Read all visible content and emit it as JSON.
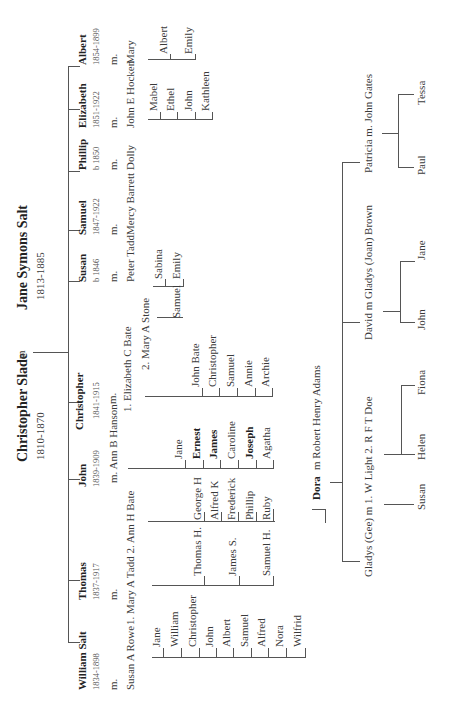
{
  "colors": {
    "line": "#555555",
    "text": "#333333",
    "background": "#ffffff"
  },
  "root": {
    "husband": {
      "name": "Christopher Slade",
      "dates": "1810-1870"
    },
    "marriage": "m",
    "wife": {
      "name": "Jane Symons Salt",
      "dates": "1813-1885"
    }
  },
  "children": [
    {
      "name": "William Salt",
      "dates": "1834-1898",
      "m": "m.",
      "spouse": "Susan A Rowe",
      "kids": [
        "Jane",
        "William",
        "Christopher",
        "John",
        "Albert",
        "Samuel",
        "Alfred",
        "Nora",
        "Wilfrid"
      ]
    },
    {
      "name": "Thomas",
      "dates": "1837-1917",
      "m": "m.",
      "spouse": "1. Mary A Tadd 2. Ann H Bate",
      "kids_1": [
        "Thomas H.",
        "James S.",
        "Samuel H."
      ],
      "kids_2": [
        "George H",
        "Alfred K",
        "Frederick",
        "Phillip",
        "Ruby",
        "Dora"
      ]
    },
    {
      "name": "John",
      "dates": "1839-1909",
      "m": "m.",
      "spouse": "m. Ann B Hanson",
      "kids": [
        "Jane",
        "Ernest",
        "James",
        "Caroline",
        "Joseph",
        "Agatha"
      ],
      "bold_kids": [
        "Ernest",
        "James",
        "Joseph"
      ]
    },
    {
      "name": "Christopher",
      "dates": "1841-1915",
      "m": "m.",
      "spouse_1": "1. Elizabeth C Bate",
      "spouse_2": "2. Mary A Stone",
      "kids_1": [
        "John Bate",
        "Christopher",
        "Samuel",
        "Annie",
        "Archie"
      ],
      "kids_2": [
        "Samuel"
      ]
    },
    {
      "name": "Susan",
      "dates": "b 1846",
      "m": "m.",
      "spouse": "Peter Tadd",
      "kids": [
        "Sabina",
        "Emily"
      ]
    },
    {
      "name": "Samuel",
      "dates": "1847-1922",
      "m": "m.",
      "spouse": "Mercy Barrett"
    },
    {
      "name": "Phillip",
      "dates": "b 1850",
      "m": "m.",
      "spouse": "Dolly"
    },
    {
      "name": "Elizabeth",
      "dates": "1851-1922",
      "m": "m.",
      "spouse": "John E Hocken",
      "kids": [
        "Mabel",
        "Ethel",
        "John",
        "Kathleen"
      ]
    },
    {
      "name": "Albert",
      "dates": "1854-1899",
      "m": "m.",
      "spouse": "Mary",
      "kids": [
        "Albert",
        "Emily"
      ]
    }
  ],
  "dora": {
    "name": "Dora",
    "spouse": "m Robert Henry Adams",
    "kids": [
      {
        "name": "Gladys (Gee) m 1. W Light  2. R F T Doe",
        "kids_1": [
          "Susan"
        ],
        "kids_2": [
          "Helen",
          "Fiona"
        ]
      },
      {
        "name": "David   m Gladys (Joan)  Brown",
        "kids": [
          "John",
          "Jane"
        ]
      },
      {
        "name": "Patricia   m. John Gates",
        "kids": [
          "Paul",
          "Tessa"
        ]
      }
    ]
  },
  "labels": [
    {
      "id": "root-husband",
      "t": "root.husband.name",
      "x": 242,
      "y": 22,
      "c": "bold big"
    },
    {
      "id": "root-husband-dates",
      "t": "root.husband.dates",
      "x": 244,
      "y": 41,
      "c": ""
    },
    {
      "id": "root-m",
      "t": "root.marriage",
      "x": 345,
      "y": 22,
      "c": ""
    },
    {
      "id": "root-wife",
      "t": "root.wife.name",
      "x": 394,
      "y": 22,
      "c": "bold big"
    },
    {
      "id": "root-wife-dates",
      "t": "root.wife.dates",
      "x": 404,
      "y": 41,
      "c": ""
    },
    {
      "id": "c0-name",
      "t": "children.0.name",
      "x": 14,
      "y": 83,
      "c": "bold"
    },
    {
      "id": "c0-dates",
      "t": "children.0.dates",
      "x": 14,
      "y": 98,
      "c": "date"
    },
    {
      "id": "c0-m",
      "t": "children.0.m",
      "x": 14,
      "y": 114,
      "c": ""
    },
    {
      "id": "c0-spouse",
      "t": "children.0.spouse",
      "x": 14,
      "y": 131,
      "c": ""
    },
    {
      "id": "c1-name",
      "t": "children.1.name",
      "x": 104,
      "y": 83,
      "c": "bold"
    },
    {
      "id": "c1-dates",
      "t": "children.1.dates",
      "x": 104,
      "y": 98,
      "c": "date"
    },
    {
      "id": "c1-m",
      "t": "children.1.m",
      "x": 104,
      "y": 114,
      "c": ""
    },
    {
      "id": "c1-spouse",
      "t": "children.1.spouse",
      "x": 79,
      "y": 131,
      "c": ""
    },
    {
      "id": "c2-name",
      "t": "children.2.name",
      "x": 217,
      "y": 83,
      "c": "bold"
    },
    {
      "id": "c2-dates",
      "t": "children.2.dates",
      "x": 217,
      "y": 98,
      "c": "date"
    },
    {
      "id": "c2-spouse",
      "t": "children.2.spouse",
      "x": 221,
      "y": 114,
      "c": ""
    },
    {
      "id": "c3-name",
      "t": "children.3.name",
      "x": 274,
      "y": 80,
      "c": "bold"
    },
    {
      "id": "c3-dates",
      "t": "children.3.dates",
      "x": 285,
      "y": 98,
      "c": "date"
    },
    {
      "id": "c3-m",
      "t": "children.3.m",
      "x": 300,
      "y": 113,
      "c": ""
    },
    {
      "id": "c3-spouse1",
      "t": "children.3.spouse_1",
      "x": 292,
      "y": 128,
      "c": ""
    },
    {
      "id": "c3-spouse2",
      "t": "children.3.spouse_2",
      "x": 334,
      "y": 146,
      "c": ""
    },
    {
      "id": "c4-name",
      "t": "children.4.name",
      "x": 422,
      "y": 83,
      "c": "bold"
    },
    {
      "id": "c4-dates",
      "t": "children.4.dates",
      "x": 422,
      "y": 98,
      "c": "date"
    },
    {
      "id": "c4-m",
      "t": "children.4.m",
      "x": 422,
      "y": 114,
      "c": ""
    },
    {
      "id": "c4-spouse",
      "t": "children.4.spouse",
      "x": 422,
      "y": 131,
      "c": ""
    },
    {
      "id": "c5-name",
      "t": "children.5.name",
      "x": 469,
      "y": 83,
      "c": "bold"
    },
    {
      "id": "c5-dates",
      "t": "children.5.dates",
      "x": 469,
      "y": 98,
      "c": "date"
    },
    {
      "id": "c5-m",
      "t": "children.5.m",
      "x": 469,
      "y": 114,
      "c": ""
    },
    {
      "id": "c5-spouse",
      "t": "children.5.spouse",
      "x": 469,
      "y": 131,
      "c": ""
    },
    {
      "id": "c6-name",
      "t": "children.6.name",
      "x": 534,
      "y": 83,
      "c": "bold"
    },
    {
      "id": "c6-dates",
      "t": "children.6.dates",
      "x": 534,
      "y": 98,
      "c": "date"
    },
    {
      "id": "c6-m",
      "t": "children.6.m",
      "x": 534,
      "y": 114,
      "c": ""
    },
    {
      "id": "c6-spouse",
      "t": "children.6.spouse",
      "x": 534,
      "y": 131,
      "c": ""
    },
    {
      "id": "c7-name",
      "t": "children.7.name",
      "x": 576,
      "y": 83,
      "c": "bold"
    },
    {
      "id": "c7-dates",
      "t": "children.7.dates",
      "x": 576,
      "y": 98,
      "c": "date"
    },
    {
      "id": "c7-m",
      "t": "children.7.m",
      "x": 576,
      "y": 114,
      "c": ""
    },
    {
      "id": "c7-spouse",
      "t": "children.7.spouse",
      "x": 576,
      "y": 131,
      "c": ""
    },
    {
      "id": "c8-name",
      "t": "children.8.name",
      "x": 639,
      "y": 83,
      "c": "bold"
    },
    {
      "id": "c8-dates",
      "t": "children.8.dates",
      "x": 639,
      "y": 98,
      "c": "date"
    },
    {
      "id": "c8-m",
      "t": "children.8.m",
      "x": 639,
      "y": 114,
      "c": ""
    },
    {
      "id": "c8-spouse",
      "t": "children.8.spouse",
      "x": 640,
      "y": 131,
      "c": ""
    },
    {
      "id": "w0",
      "t": "children.0.kids.0",
      "x": 57,
      "y": 157,
      "c": ""
    },
    {
      "id": "w1",
      "t": "children.0.kids.1",
      "x": 57,
      "y": 175,
      "c": ""
    },
    {
      "id": "w2",
      "t": "children.0.kids.2",
      "x": 57,
      "y": 193,
      "c": ""
    },
    {
      "id": "w3",
      "t": "children.0.kids.3",
      "x": 57,
      "y": 210,
      "c": ""
    },
    {
      "id": "w4",
      "t": "children.0.kids.4",
      "x": 57,
      "y": 227,
      "c": ""
    },
    {
      "id": "w5",
      "t": "children.0.kids.5",
      "x": 57,
      "y": 245,
      "c": ""
    },
    {
      "id": "w6",
      "t": "children.0.kids.6",
      "x": 57,
      "y": 262,
      "c": ""
    },
    {
      "id": "w7",
      "t": "children.0.kids.7",
      "x": 57,
      "y": 280,
      "c": ""
    },
    {
      "id": "w8",
      "t": "children.0.kids.8",
      "x": 57,
      "y": 298,
      "c": ""
    },
    {
      "id": "t0",
      "t": "children.1.kids_1.0",
      "x": 128,
      "y": 198,
      "c": ""
    },
    {
      "id": "t1",
      "t": "children.1.kids_1.1",
      "x": 128,
      "y": 233,
      "c": ""
    },
    {
      "id": "t2",
      "t": "children.1.kids_1.2",
      "x": 128,
      "y": 267,
      "c": ""
    },
    {
      "id": "a0",
      "t": "children.1.kids_2.0",
      "x": 184,
      "y": 198,
      "c": ""
    },
    {
      "id": "a1",
      "t": "children.1.kids_2.1",
      "x": 184,
      "y": 215,
      "c": ""
    },
    {
      "id": "a2",
      "t": "children.1.kids_2.2",
      "x": 184,
      "y": 232,
      "c": ""
    },
    {
      "id": "a3",
      "t": "children.1.kids_2.3",
      "x": 184,
      "y": 250,
      "c": ""
    },
    {
      "id": "a4",
      "t": "children.1.kids_2.4",
      "x": 184,
      "y": 267,
      "c": ""
    },
    {
      "id": "j0",
      "t": "children.2.kids.0",
      "x": 245,
      "y": 179,
      "c": ""
    },
    {
      "id": "j1",
      "t": "children.2.kids.1",
      "x": 245,
      "y": 197,
      "c": "bold"
    },
    {
      "id": "j2",
      "t": "children.2.kids.2",
      "x": 245,
      "y": 214,
      "c": "bold"
    },
    {
      "id": "j3",
      "t": "children.2.kids.3",
      "x": 245,
      "y": 232,
      "c": ""
    },
    {
      "id": "j4",
      "t": "children.2.kids.4",
      "x": 245,
      "y": 250,
      "c": "bold"
    },
    {
      "id": "j5",
      "t": "children.2.kids.5",
      "x": 245,
      "y": 267,
      "c": ""
    },
    {
      "id": "k0",
      "t": "children.3.kids_1.0",
      "x": 317,
      "y": 196,
      "c": ""
    },
    {
      "id": "k1",
      "t": "children.3.kids_1.1",
      "x": 317,
      "y": 213,
      "c": ""
    },
    {
      "id": "k2",
      "t": "children.3.kids_1.2",
      "x": 317,
      "y": 231,
      "c": ""
    },
    {
      "id": "k3",
      "t": "children.3.kids_1.3",
      "x": 317,
      "y": 249,
      "c": ""
    },
    {
      "id": "k4",
      "t": "children.3.kids_1.4",
      "x": 317,
      "y": 266,
      "c": ""
    },
    {
      "id": "k5",
      "t": "children.3.kids_2.0",
      "x": 386,
      "y": 177,
      "c": ""
    },
    {
      "id": "s0",
      "t": "children.4.kids.0",
      "x": 425,
      "y": 159,
      "c": ""
    },
    {
      "id": "s1",
      "t": "children.4.kids.1",
      "x": 425,
      "y": 177,
      "c": ""
    },
    {
      "id": "e0",
      "t": "children.7.kids.0",
      "x": 593,
      "y": 154,
      "c": ""
    },
    {
      "id": "e1",
      "t": "children.7.kids.1",
      "x": 593,
      "y": 171,
      "c": ""
    },
    {
      "id": "e2",
      "t": "children.7.kids.2",
      "x": 593,
      "y": 189,
      "c": ""
    },
    {
      "id": "e3",
      "t": "children.7.kids.3",
      "x": 593,
      "y": 206,
      "c": ""
    },
    {
      "id": "b0",
      "t": "children.8.kids.0",
      "x": 650,
      "y": 164,
      "c": ""
    },
    {
      "id": "b1",
      "t": "children.8.kids.1",
      "x": 650,
      "y": 189,
      "c": ""
    },
    {
      "id": "dora",
      "t": "dora.name",
      "x": 204,
      "y": 317,
      "c": "bold"
    },
    {
      "id": "dora-spouse",
      "t": "dora.spouse",
      "x": 234,
      "y": 317,
      "c": ""
    },
    {
      "id": "g",
      "t": "dora.kids.0.name",
      "x": 127,
      "y": 369,
      "c": ""
    },
    {
      "id": "g-s",
      "t": "dora.kids.0.kids_1.0",
      "x": 194,
      "y": 422,
      "c": ""
    },
    {
      "id": "g-h",
      "t": "dora.kids.0.kids_2.0",
      "x": 244,
      "y": 422,
      "c": ""
    },
    {
      "id": "g-f",
      "t": "dora.kids.0.kids_2.1",
      "x": 309,
      "y": 422,
      "c": ""
    },
    {
      "id": "d",
      "t": "dora.kids.1.name",
      "x": 364,
      "y": 369,
      "c": ""
    },
    {
      "id": "d-j",
      "t": "dora.kids.1.kids.0",
      "x": 374,
      "y": 422,
      "c": ""
    },
    {
      "id": "d-ja",
      "t": "dora.kids.1.kids.1",
      "x": 444,
      "y": 422,
      "c": ""
    },
    {
      "id": "p",
      "t": "dora.kids.2.name",
      "x": 531,
      "y": 369,
      "c": ""
    },
    {
      "id": "p-p",
      "t": "dora.kids.2.kids.0",
      "x": 529,
      "y": 422,
      "c": ""
    },
    {
      "id": "p-t",
      "t": "dora.kids.2.kids.1",
      "x": 599,
      "y": 422,
      "c": ""
    }
  ],
  "lines": [
    [
      351,
      33,
      1,
      35
    ],
    [
      61,
      68,
      577,
      1
    ],
    [
      61,
      68,
      1,
      12
    ],
    [
      123,
      68,
      1,
      12
    ],
    [
      224,
      68,
      1,
      12
    ],
    [
      301,
      68,
      1,
      12
    ],
    [
      422,
      68,
      1,
      12
    ],
    [
      473,
      68,
      1,
      12
    ],
    [
      532,
      68,
      1,
      12
    ],
    [
      594,
      68,
      1,
      12
    ],
    [
      637,
      68,
      1,
      12
    ],
    [
      46,
      152,
      1,
      154
    ],
    [
      46,
      163,
      10,
      1
    ],
    [
      46,
      181,
      10,
      1
    ],
    [
      46,
      199,
      10,
      1
    ],
    [
      46,
      216,
      10,
      1
    ],
    [
      46,
      233,
      10,
      1
    ],
    [
      46,
      251,
      10,
      1
    ],
    [
      46,
      268,
      10,
      1
    ],
    [
      46,
      286,
      10,
      1
    ],
    [
      46,
      305,
      10,
      1
    ],
    [
      118,
      152,
      1,
      121
    ],
    [
      118,
      204,
      10,
      1
    ],
    [
      118,
      239,
      10,
      1
    ],
    [
      118,
      273,
      10,
      1
    ],
    [
      182,
      148,
      1,
      127
    ],
    [
      182,
      204,
      10,
      1
    ],
    [
      182,
      221,
      10,
      1
    ],
    [
      182,
      238,
      10,
      1
    ],
    [
      182,
      256,
      10,
      1
    ],
    [
      182,
      273,
      10,
      1
    ],
    [
      182,
      273,
      12,
      1
    ],
    [
      194,
      273,
      1,
      1
    ],
    [
      181,
      325,
      13,
      1
    ],
    [
      194,
      312,
      1,
      14
    ],
    [
      235,
      128,
      1,
      146
    ],
    [
      235,
      185,
      9,
      1
    ],
    [
      235,
      203,
      9,
      1
    ],
    [
      235,
      220,
      9,
      1
    ],
    [
      235,
      238,
      9,
      1
    ],
    [
      235,
      256,
      9,
      1
    ],
    [
      235,
      273,
      9,
      1
    ],
    [
      307,
      145,
      1,
      128
    ],
    [
      307,
      202,
      9,
      1
    ],
    [
      307,
      219,
      9,
      1
    ],
    [
      307,
      237,
      9,
      1
    ],
    [
      307,
      255,
      9,
      1
    ],
    [
      307,
      272,
      9,
      1
    ],
    [
      386,
      157,
      1,
      10
    ],
    [
      386,
      167,
      1,
      16
    ],
    [
      386,
      182,
      1,
      1
    ],
    [
      417,
      153,
      1,
      30
    ],
    [
      417,
      165,
      8,
      1
    ],
    [
      417,
      183,
      8,
      1
    ],
    [
      584,
      148,
      1,
      64
    ],
    [
      584,
      160,
      8,
      1
    ],
    [
      584,
      177,
      8,
      1
    ],
    [
      584,
      195,
      8,
      1
    ],
    [
      584,
      212,
      8,
      1
    ],
    [
      644,
      148,
      1,
      47
    ],
    [
      644,
      170,
      6,
      1
    ],
    [
      644,
      195,
      6,
      1
    ],
    [
      221,
      330,
      1,
      12
    ],
    [
      142,
      342,
      400,
      1
    ],
    [
      142,
      342,
      1,
      18
    ],
    [
      381,
      342,
      1,
      18
    ],
    [
      541,
      342,
      1,
      18
    ],
    [
      199,
      384,
      1,
      30
    ],
    [
      249,
      384,
      1,
      17
    ],
    [
      249,
      401,
      70,
      1
    ],
    [
      249,
      401,
      1,
      14
    ],
    [
      318,
      401,
      1,
      14
    ],
    [
      392,
      383,
      1,
      17
    ],
    [
      381,
      400,
      61,
      1
    ],
    [
      381,
      400,
      1,
      15
    ],
    [
      442,
      400,
      1,
      15
    ],
    [
      570,
      382,
      1,
      16
    ],
    [
      536,
      398,
      73,
      1
    ],
    [
      536,
      398,
      1,
      16
    ],
    [
      609,
      398,
      1,
      16
    ]
  ]
}
